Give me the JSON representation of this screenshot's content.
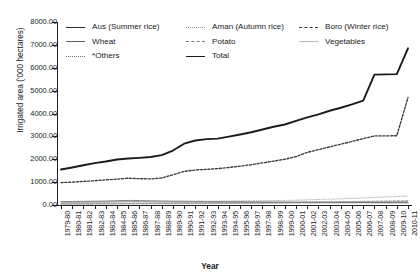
{
  "axes": {
    "ylabel": "Irrigated area ('000 hectares)",
    "xlabel": "Year",
    "yticks": [
      "8000.00",
      "7000.00",
      "6000.00",
      "5000.00",
      "4000.00",
      "3000.00",
      "2000.00",
      "1000.00",
      "0.00"
    ]
  },
  "legend": {
    "items": [
      {
        "label": "Aus (Summer rice)",
        "style": "s-solid"
      },
      {
        "label": "Aman (Autumn rice)",
        "style": "s-dot2"
      },
      {
        "label": "Boro (Winter rice)",
        "style": "s-dashed"
      },
      {
        "label": "Wheat",
        "style": "s-thin"
      },
      {
        "label": "Potato",
        "style": "s-dash2"
      },
      {
        "label": "Vegetables",
        "style": "s-faint"
      },
      {
        "label": "*Others",
        "style": "s-dotted"
      },
      {
        "label": "Total",
        "style": "s-thick"
      }
    ]
  },
  "chart_data": {
    "type": "line",
    "title": "",
    "xlabel": "Year",
    "ylabel": "Irrigated area ('000 hectares)",
    "ylim": [
      0,
      8000
    ],
    "ytick_step": 1000,
    "grid": false,
    "legend_position": "top",
    "categories": [
      "1979-80",
      "1980-81",
      "1981-82",
      "1982-83",
      "1983-84",
      "1984-85",
      "1985-86",
      "1986-87",
      "1987-88",
      "1988-89",
      "1989-90",
      "1990-91",
      "1991-92",
      "1992-93",
      "1993-94",
      "1994-95",
      "1995-96",
      "1996-97",
      "1997-98",
      "1998-99",
      "1999-00",
      "2000-01",
      "2001-02",
      "2002-03",
      "2003-04",
      "2004-05",
      "2005-06",
      "2006-07",
      "2007-08",
      "2008-09",
      "2009-10",
      "2010-11"
    ],
    "series": [
      {
        "name": "Total",
        "style": "solid-thick",
        "color": "#1b1b1b",
        "values": [
          1550,
          1640,
          1740,
          1830,
          1900,
          1990,
          2030,
          2060,
          2100,
          2180,
          2380,
          2680,
          2820,
          2880,
          2900,
          2990,
          3080,
          3180,
          3300,
          3420,
          3520,
          3680,
          3830,
          3960,
          4120,
          4250,
          4400,
          4560,
          5700,
          5710,
          5720,
          6850
        ]
      },
      {
        "name": "Boro (Winter rice)",
        "style": "dotted",
        "color": "#3a3a3a",
        "values": [
          980,
          1000,
          1030,
          1060,
          1100,
          1130,
          1170,
          1150,
          1140,
          1180,
          1320,
          1470,
          1530,
          1560,
          1590,
          1640,
          1700,
          1760,
          1840,
          1920,
          2000,
          2120,
          2300,
          2420,
          2540,
          2660,
          2780,
          2900,
          3020,
          3020,
          3030,
          4700
        ]
      },
      {
        "name": "Aus (Summer rice)",
        "style": "solid",
        "color": "#5d5d5d",
        "values": [
          150,
          155,
          160,
          165,
          175,
          190,
          200,
          195,
          185,
          175,
          170,
          165,
          160,
          155,
          150,
          148,
          145,
          140,
          138,
          135,
          132,
          130,
          128,
          125,
          122,
          120,
          118,
          115,
          112,
          110,
          108,
          105
        ]
      },
      {
        "name": "Aman (Autumn rice)",
        "style": "dotted-light",
        "color": "#9a9a9a",
        "values": [
          90,
          95,
          100,
          105,
          115,
          130,
          145,
          150,
          148,
          145,
          150,
          155,
          160,
          165,
          170,
          175,
          180,
          185,
          190,
          195,
          200,
          210,
          225,
          240,
          255,
          270,
          290,
          310,
          330,
          350,
          370,
          390
        ]
      },
      {
        "name": "Wheat",
        "style": "thin",
        "color": "#7a7a7a",
        "values": [
          120,
          125,
          130,
          135,
          140,
          145,
          150,
          145,
          140,
          135,
          130,
          128,
          125,
          122,
          120,
          118,
          115,
          112,
          110,
          108,
          106,
          104,
          102,
          100,
          98,
          96,
          95,
          93,
          92,
          90,
          89,
          88
        ]
      },
      {
        "name": "Potato",
        "style": "dashed-light",
        "color": "#8a8a8a",
        "values": [
          40,
          42,
          45,
          48,
          52,
          56,
          60,
          62,
          64,
          66,
          68,
          70,
          72,
          75,
          78,
          82,
          86,
          90,
          95,
          100,
          105,
          112,
          120,
          128,
          136,
          144,
          152,
          160,
          170,
          180,
          190,
          200
        ]
      },
      {
        "name": "Vegetables",
        "style": "faint",
        "color": "#b9b9b9",
        "values": [
          30,
          31,
          33,
          35,
          37,
          40,
          43,
          45,
          46,
          48,
          50,
          52,
          54,
          56,
          58,
          61,
          64,
          67,
          70,
          74,
          78,
          82,
          87,
          92,
          97,
          103,
          109,
          115,
          122,
          129,
          136,
          143
        ]
      },
      {
        "name": "*Others",
        "style": "dotted-fine",
        "color": "#6f6f6f",
        "values": [
          60,
          62,
          64,
          66,
          69,
          72,
          75,
          76,
          77,
          78,
          80,
          82,
          84,
          86,
          88,
          90,
          93,
          96,
          99,
          102,
          105,
          109,
          113,
          117,
          121,
          125,
          130,
          135,
          140,
          145,
          150,
          155
        ]
      }
    ]
  }
}
